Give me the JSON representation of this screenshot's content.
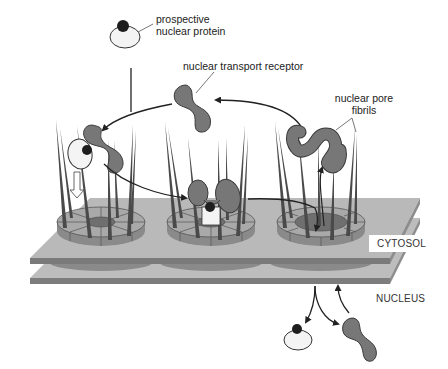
{
  "diagram": {
    "labels": {
      "prospective_protein_line1": "prospective",
      "prospective_protein_line2": "nuclear protein",
      "transport_receptor": "nuclear transport receptor",
      "pore_fibrils_line1": "nuclear pore",
      "pore_fibrils_line2": "fibrils",
      "cytosol": "CYTOSOL",
      "nucleus": "NUCLEUS"
    },
    "colors": {
      "background": "#ffffff",
      "membrane_top": "#b9b9b9",
      "membrane_edge": "#7a7a7a",
      "pore_ring_top": "#a9a9a9",
      "pore_ring_side": "#8a8a8a",
      "pore_hole": "#6f6f6f",
      "fibril": "#4a4a4a",
      "receptor": "#777777",
      "receptor_outline": "#3a3a3a",
      "cargo_body": "#f4f4f4",
      "nls_signal": "#1e1e1e",
      "arrow": "#222222"
    },
    "stages": [
      {
        "name": "docking",
        "description": "receptor-cargo complex binds fibrils"
      },
      {
        "name": "translocation",
        "description": "complex passes into pore"
      },
      {
        "name": "release",
        "description": "complex enters nucleus"
      }
    ]
  }
}
